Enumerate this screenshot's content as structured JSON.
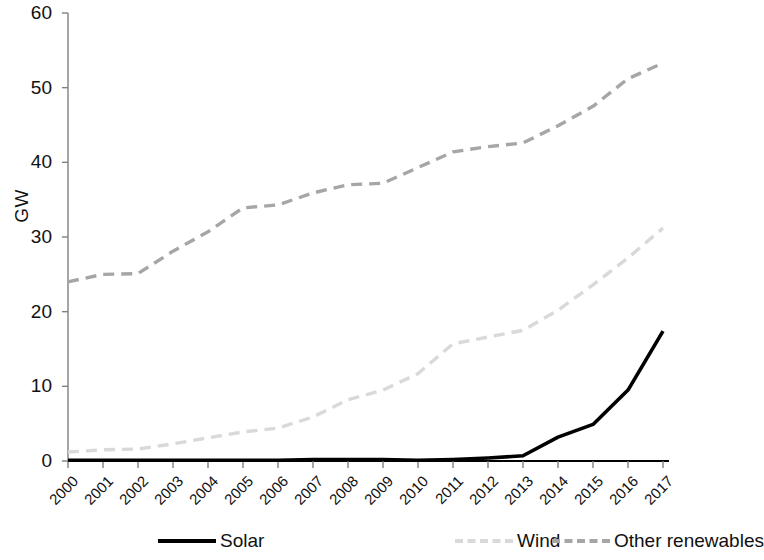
{
  "chart_data": {
    "type": "line",
    "title": "",
    "xlabel": "",
    "ylabel": "GW",
    "x": [
      "2000",
      "2001",
      "2002",
      "2003",
      "2004",
      "2005",
      "2006",
      "2007",
      "2008",
      "2009",
      "2010",
      "2011",
      "2012",
      "2013",
      "2014",
      "2015",
      "2016",
      "2017"
    ],
    "ylim": [
      0,
      60
    ],
    "yticks": [
      0,
      10,
      20,
      30,
      40,
      50,
      60
    ],
    "grid": false,
    "legend_position": "bottom",
    "series": [
      {
        "name": "Solar",
        "color": "#000000",
        "style": "solid",
        "values": [
          0.1,
          0.1,
          0.1,
          0.1,
          0.1,
          0.1,
          0.1,
          0.2,
          0.2,
          0.2,
          0.1,
          0.2,
          0.4,
          0.7,
          3.2,
          4.9,
          9.5,
          17.4
        ]
      },
      {
        "name": "Wind",
        "color": "#d9d9d9",
        "style": "dashed",
        "values": [
          1.2,
          1.5,
          1.6,
          2.3,
          3.1,
          3.9,
          4.4,
          5.9,
          8.2,
          9.5,
          11.7,
          15.7,
          16.6,
          17.5,
          20.2,
          23.6,
          27.2,
          31.2
        ]
      },
      {
        "name": "Other renewables",
        "color": "#a6a6a6",
        "style": "dashed",
        "values": [
          24.0,
          25.0,
          25.1,
          28.1,
          30.7,
          33.9,
          34.3,
          35.9,
          37.0,
          37.2,
          39.3,
          41.4,
          42.1,
          42.6,
          44.9,
          47.5,
          51.2,
          53.3
        ]
      }
    ]
  },
  "axis": {
    "y_title": "GW",
    "y_tick_labels": [
      "0",
      "10",
      "20",
      "30",
      "40",
      "50",
      "60"
    ],
    "x_tick_labels": [
      "2000",
      "2001",
      "2002",
      "2003",
      "2004",
      "2005",
      "2006",
      "2007",
      "2008",
      "2009",
      "2010",
      "2011",
      "2012",
      "2013",
      "2014",
      "2015",
      "2016",
      "2017"
    ]
  },
  "legend": {
    "items": [
      {
        "label": "Solar",
        "color": "#000000",
        "style": "solid"
      },
      {
        "label": "Wind",
        "color": "#d9d9d9",
        "style": "dashed"
      },
      {
        "label": "Other renewables",
        "color": "#a6a6a6",
        "style": "dashed"
      }
    ]
  },
  "colors": {
    "solar": "#000000",
    "wind": "#d9d9d9",
    "other_renewables": "#a6a6a6",
    "axis": "#808080",
    "baseline": "#000000",
    "text": "#111111",
    "background": "#ffffff"
  }
}
